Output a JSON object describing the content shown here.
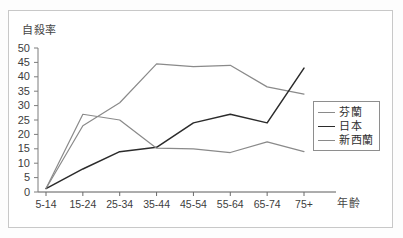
{
  "chart_data": {
    "type": "line",
    "title": "",
    "xlabel": "年齡",
    "ylabel": "自殺率",
    "categories": [
      "5-14",
      "15-24",
      "25-34",
      "35-44",
      "45-54",
      "55-64",
      "65-74",
      "75+"
    ],
    "ylim": [
      0,
      50
    ],
    "yticks": [
      50,
      45,
      40,
      35,
      30,
      25,
      20,
      15,
      10,
      5,
      0
    ],
    "grid": false,
    "legend_position": "right",
    "series": [
      {
        "name": "芬蘭",
        "color": "#8a8a8a",
        "values": [
          1.2,
          23.0,
          31.0,
          44.5,
          43.5,
          44.0,
          36.5,
          34.0
        ]
      },
      {
        "name": "日本",
        "color": "#2b2b2b",
        "values": [
          1.2,
          8.0,
          14.0,
          15.5,
          24.0,
          27.0,
          24.0,
          43.0
        ]
      },
      {
        "name": "新西蘭",
        "color": "#8a8a8a",
        "values": [
          1.2,
          27.0,
          25.0,
          15.2,
          15.0,
          13.7,
          17.4,
          14.0
        ]
      }
    ]
  },
  "legend": {
    "items": [
      {
        "label": "芬蘭"
      },
      {
        "label": "日本"
      },
      {
        "label": "新西蘭"
      }
    ]
  }
}
